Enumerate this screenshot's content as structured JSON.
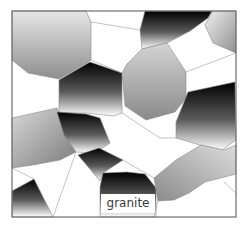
{
  "figure": {
    "label": "granite",
    "frame": {
      "x": 12,
      "y": 11,
      "width": 224,
      "height": 206,
      "stroke": "#6e6e6e"
    },
    "colors": {
      "background": "#ffffff",
      "grain_edge": "#8c8c8c",
      "label_text": "#3a3a3a"
    },
    "grains": [
      {
        "id": "top-left-gray",
        "points": "12,11 86,11 91,22 91,60 87,63 59,79 28,73 12,60",
        "gradient": "g-gray-v"
      },
      {
        "id": "center-left-dark",
        "points": "90,62 122,73 122,113 114,116 86,113 59,113 59,80",
        "gradient": "g-dark-v"
      },
      {
        "id": "top-center-dark",
        "points": "145,11 212,11 208,18 190,31 167,43 142,49 140,30",
        "gradient": "g-dark-v"
      },
      {
        "id": "top-right-gray",
        "points": "213,11 236,11 236,53 213,43 205,25",
        "gradient": "g-gray-h"
      },
      {
        "id": "center-gray",
        "points": "142,49 167,43 186,72 186,98 175,112 146,120 125,106 122,73 127,64",
        "gradient": "g-gray-v2"
      },
      {
        "id": "right-dark",
        "points": "188,92 235,82 236,140 222,150 200,145 176,138 176,122",
        "gradient": "g-dark-v"
      },
      {
        "id": "left-middle-gray",
        "points": "12,118 57,108 76,152 60,160 33,165 12,168",
        "gradient": "g-gray-d"
      },
      {
        "id": "under-center-dark",
        "points": "57,112 86,114 100,118 110,143 95,153 76,152 64,135",
        "gradient": "g-dark-v"
      },
      {
        "id": "small-dark-wedge",
        "points": "78,155 99,148 123,160 103,173 100,181",
        "gradient": "g-dark-v"
      },
      {
        "id": "bottom-center-dark",
        "points": "103,173 127,172 145,174 156,188 156,217 100,217 100,187",
        "gradient": "g-dark-v"
      },
      {
        "id": "bottom-right-gray",
        "points": "154,178 176,160 201,145 224,150 236,145 236,174 205,182 189,193 174,200 158,201",
        "gradient": "g-gray-d2"
      },
      {
        "id": "bottom-left-dark",
        "points": "12,191 34,179 53,217 12,217",
        "gradient": "g-dark-v"
      }
    ],
    "edges": [
      {
        "x1": 91,
        "y1": 60,
        "x2": 122,
        "y2": 73
      },
      {
        "x1": 122,
        "y1": 113,
        "x2": 160,
        "y2": 138
      },
      {
        "x1": 160,
        "y1": 138,
        "x2": 176,
        "y2": 138
      },
      {
        "x1": 186,
        "y1": 72,
        "x2": 236,
        "y2": 53
      },
      {
        "x1": 57,
        "y1": 108,
        "x2": 59,
        "y2": 80
      },
      {
        "x1": 12,
        "y1": 168,
        "x2": 34,
        "y2": 179
      },
      {
        "x1": 53,
        "y1": 217,
        "x2": 76,
        "y2": 152
      },
      {
        "x1": 123,
        "y1": 160,
        "x2": 154,
        "y2": 178
      },
      {
        "x1": 158,
        "y1": 201,
        "x2": 154,
        "y2": 217
      },
      {
        "x1": 224,
        "y1": 182,
        "x2": 236,
        "y2": 193
      },
      {
        "x1": 91,
        "y1": 22,
        "x2": 140,
        "y2": 30
      }
    ]
  }
}
